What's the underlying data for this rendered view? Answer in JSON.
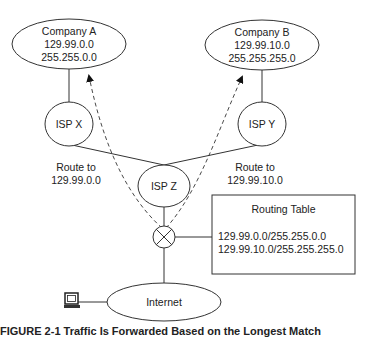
{
  "nodes": {
    "company_a": {
      "name": "Company A",
      "network": "129.99.0.0",
      "mask": "255.255.0.0"
    },
    "company_b": {
      "name": "Company B",
      "network": "129.99.10.0",
      "mask": "255.255.255.0"
    },
    "isp_x": {
      "name": "ISP X"
    },
    "isp_y": {
      "name": "ISP Y"
    },
    "isp_z": {
      "name": "ISP Z"
    },
    "internet": {
      "name": "Internet"
    }
  },
  "routes": {
    "left": {
      "line1": "Route to",
      "line2": "129.99.0.0"
    },
    "right": {
      "line1": "Route to",
      "line2": "129.99.10.0"
    }
  },
  "routing_table": {
    "title": "Routing Table",
    "entries": [
      "129.99.0.0/255.255.0.0",
      "129.99.10.0/255.255.255.0"
    ]
  },
  "caption": "FIGURE 2-1   Traffic Is Forwarded Based on the Longest Match"
}
